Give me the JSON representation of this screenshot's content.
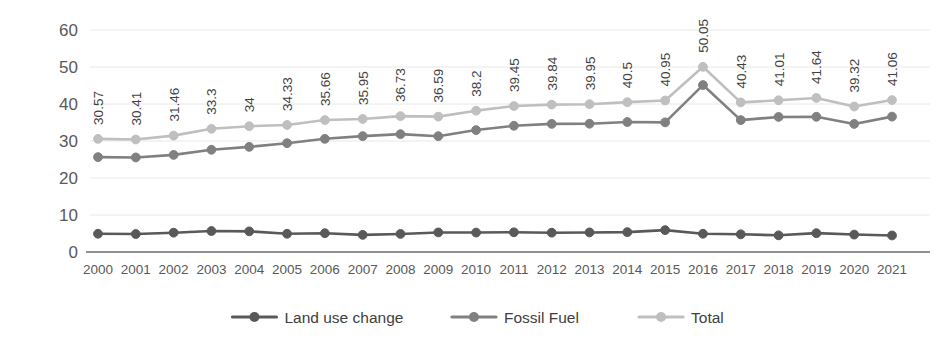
{
  "chart_data": {
    "type": "line",
    "title": "",
    "xlabel": "",
    "ylabel": "",
    "ylim": [
      0,
      60
    ],
    "ytick_step": 10,
    "yticks": [
      "0",
      "10",
      "20",
      "30",
      "40",
      "50",
      "60"
    ],
    "grid": true,
    "legend_position": "bottom",
    "categories": [
      "2000",
      "2001",
      "2002",
      "2003",
      "2004",
      "2005",
      "2006",
      "2007",
      "2008",
      "2009",
      "2010",
      "2011",
      "2012",
      "2013",
      "2014",
      "2015",
      "2016",
      "2017",
      "2018",
      "2019",
      "2020",
      "2021"
    ],
    "series": [
      {
        "name": "Land use change",
        "color": "#595959",
        "values": [
          4.93,
          4.86,
          5.22,
          5.67,
          5.58,
          4.93,
          5.07,
          4.63,
          4.88,
          5.29,
          5.25,
          5.33,
          5.21,
          5.29,
          5.37,
          5.91,
          4.93,
          4.78,
          4.51,
          5.09,
          4.71,
          4.47
        ]
      },
      {
        "name": "Fossil Fuel",
        "color": "#808080",
        "values": [
          25.64,
          25.55,
          26.24,
          27.63,
          28.42,
          29.4,
          30.59,
          31.32,
          31.85,
          31.3,
          32.95,
          34.12,
          34.63,
          34.66,
          35.13,
          35.04,
          45.12,
          35.65,
          36.5,
          36.55,
          34.61,
          36.59
        ]
      },
      {
        "name": "Total",
        "color": "#bfbfbf",
        "values": [
          30.57,
          30.41,
          31.46,
          33.3,
          34,
          34.33,
          35.66,
          35.95,
          36.73,
          36.59,
          38.2,
          39.45,
          39.84,
          39.95,
          40.5,
          40.95,
          50.05,
          40.43,
          41.01,
          41.64,
          39.32,
          41.06
        ]
      }
    ],
    "data_labels": {
      "series": "Total",
      "values": [
        "30.57",
        "30.41",
        "31.46",
        "33.3",
        "34",
        "34.33",
        "35.66",
        "35.95",
        "36.73",
        "36.59",
        "38.2",
        "39.45",
        "39.84",
        "39.95",
        "40.5",
        "40.95",
        "50.05",
        "40.43",
        "41.01",
        "41.64",
        "39.32",
        "41.06"
      ]
    },
    "legend": [
      {
        "label": "Land use change",
        "color": "#595959"
      },
      {
        "label": "Fossil Fuel",
        "color": "#808080"
      },
      {
        "label": "Total",
        "color": "#bfbfbf"
      }
    ]
  }
}
